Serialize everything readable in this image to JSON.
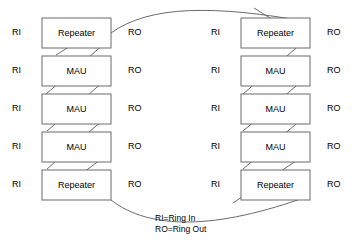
{
  "diagram": {
    "colors": {
      "stroke": "#6b6b6b",
      "box_fill": "#ffffff",
      "text": "#000000",
      "background": "#ffffff"
    },
    "port_labels": {
      "ring_in": "RI",
      "ring_out": "RO"
    },
    "left_column": {
      "name": "left-stack",
      "nodes": [
        {
          "id": "left-1",
          "label": "Repeater",
          "ring_in": "RI",
          "ring_out": "RO"
        },
        {
          "id": "left-2",
          "label": "MAU",
          "ring_in": "RI",
          "ring_out": "RO"
        },
        {
          "id": "left-3",
          "label": "MAU",
          "ring_in": "RI",
          "ring_out": "RO"
        },
        {
          "id": "left-4",
          "label": "MAU",
          "ring_in": "RI",
          "ring_out": "RO"
        },
        {
          "id": "left-5",
          "label": "Repeater",
          "ring_in": "RI",
          "ring_out": "RO"
        }
      ]
    },
    "right_column": {
      "name": "right-stack",
      "nodes": [
        {
          "id": "right-1",
          "label": "Repeater",
          "ring_in": "RI",
          "ring_out": "RO"
        },
        {
          "id": "right-2",
          "label": "MAU",
          "ring_in": "RI",
          "ring_out": "RO"
        },
        {
          "id": "right-3",
          "label": "MAU",
          "ring_in": "RI",
          "ring_out": "RO"
        },
        {
          "id": "right-4",
          "label": "MAU",
          "ring_in": "RI",
          "ring_out": "RO"
        },
        {
          "id": "right-5",
          "label": "Repeater",
          "ring_in": "RI",
          "ring_out": "RO"
        }
      ]
    },
    "legend": {
      "line1": "RI=Ring In",
      "line2": "RO=Ring Out"
    }
  }
}
